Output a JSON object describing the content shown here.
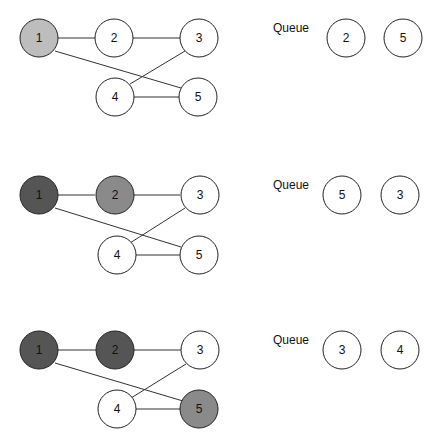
{
  "colors": {
    "unvisited": "#ffffff",
    "current": "#bdbdbd",
    "discovered": "#8a8a8a",
    "visited": "#555555",
    "stroke": "#222222",
    "edge": "#333333"
  },
  "graph": {
    "edges": [
      [
        1,
        2
      ],
      [
        2,
        3
      ],
      [
        1,
        5
      ],
      [
        3,
        4
      ],
      [
        4,
        5
      ]
    ]
  },
  "steps": [
    {
      "nodes": [
        {
          "id": "1",
          "label": "1",
          "state": "current"
        },
        {
          "id": "2",
          "label": "2",
          "state": "unvisited"
        },
        {
          "id": "3",
          "label": "3",
          "state": "unvisited"
        },
        {
          "id": "4",
          "label": "4",
          "state": "unvisited"
        },
        {
          "id": "5",
          "label": "5",
          "state": "unvisited"
        }
      ],
      "queue_label": "Queue",
      "queue": [
        "2",
        "5"
      ]
    },
    {
      "nodes": [
        {
          "id": "1",
          "label": "1",
          "state": "visited"
        },
        {
          "id": "2",
          "label": "2",
          "state": "discovered"
        },
        {
          "id": "3",
          "label": "3",
          "state": "unvisited"
        },
        {
          "id": "4",
          "label": "4",
          "state": "unvisited"
        },
        {
          "id": "5",
          "label": "5",
          "state": "unvisited"
        }
      ],
      "queue_label": "Queue",
      "queue": [
        "5",
        "3"
      ]
    },
    {
      "nodes": [
        {
          "id": "1",
          "label": "1",
          "state": "visited"
        },
        {
          "id": "2",
          "label": "2",
          "state": "visited"
        },
        {
          "id": "3",
          "label": "3",
          "state": "unvisited"
        },
        {
          "id": "4",
          "label": "4",
          "state": "unvisited"
        },
        {
          "id": "5",
          "label": "5",
          "state": "discovered"
        }
      ],
      "queue_label": "Queue",
      "queue": [
        "3",
        "4"
      ]
    }
  ]
}
